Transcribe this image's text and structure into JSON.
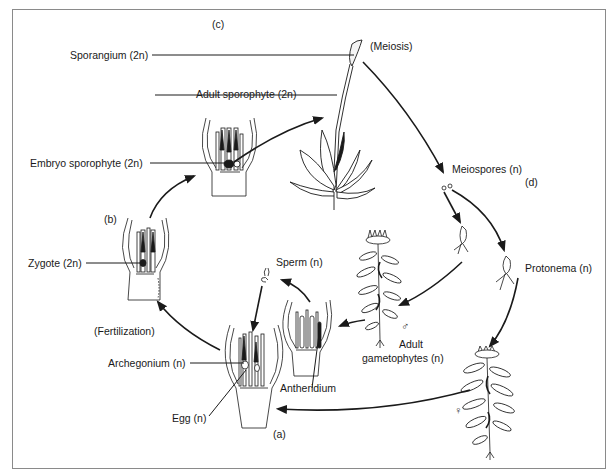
{
  "diagram": {
    "stages": {
      "a": "(a)",
      "b": "(b)",
      "c": "(c)",
      "d": "(d)"
    },
    "labels": {
      "sporangium": "Sporangium (2n)",
      "meiosis": "(Meiosis)",
      "adult_sporophyte": "Adult sporophyte (2n)",
      "embryo_sporophyte": "Embryo sporophyte (2n)",
      "meiospores": "Meiospores (n)",
      "zygote": "Zygote (2n)",
      "sperm": "Sperm (n)",
      "protonema": "Protonema (n)",
      "fertilization": "(Fertilization)",
      "archegonium": "Archegonium (n)",
      "antheridium": "Antheridium",
      "egg": "Egg (n)",
      "adult_gametophytes_line1": "Adult",
      "adult_gametophytes_line2": "gametophytes (n)"
    },
    "symbols": {
      "male": "♂",
      "female": "♀"
    },
    "colors": {
      "ink": "#1a1a1a",
      "frame": "#8a8a8a",
      "background": "#ffffff"
    }
  }
}
